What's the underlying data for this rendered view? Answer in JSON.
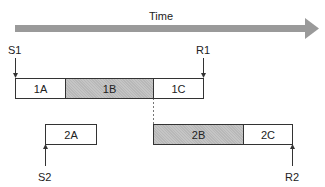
{
  "time_axis": {
    "label": "Time",
    "color": "#9a9a9a"
  },
  "markers": {
    "s1": "S1",
    "r1": "R1",
    "s2": "S2",
    "r2": "R2"
  },
  "row1": [
    {
      "id": "1A",
      "label": "1A",
      "shaded": false
    },
    {
      "id": "1B",
      "label": "1B",
      "shaded": true
    },
    {
      "id": "1C",
      "label": "1C",
      "shaded": false
    }
  ],
  "row2": [
    {
      "id": "2A",
      "label": "2A",
      "shaded": false
    },
    {
      "id": "2B",
      "label": "2B",
      "shaded": true
    },
    {
      "id": "2C",
      "label": "2C",
      "shaded": false
    }
  ],
  "colors": {
    "shade": "#b8b8b8",
    "line": "#333333"
  }
}
